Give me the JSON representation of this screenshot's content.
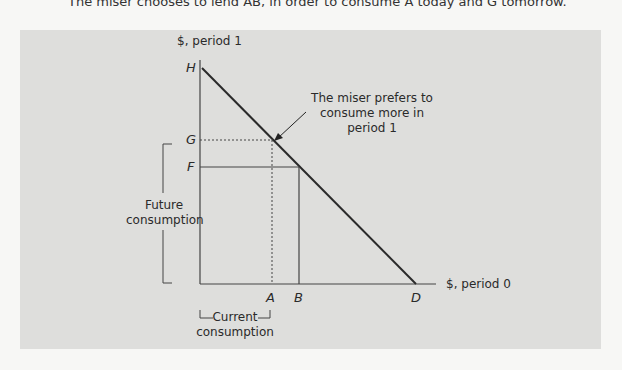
{
  "caption": "The miser chooses to lend AB, in order to consume A today and G tomorrow.",
  "axes": {
    "y_label": "$, period 1",
    "x_label": "$, period 0"
  },
  "points": {
    "H": "H",
    "G": "G",
    "F": "F",
    "A": "A",
    "B": "B",
    "D": "D"
  },
  "annotation": {
    "line1": "The miser prefers to",
    "line2": "consume more in",
    "line3": "period 1"
  },
  "brackets": {
    "future_line1": "Future",
    "future_line2": "consumption",
    "current_line1": "Current",
    "current_line2": "consumption"
  },
  "colors": {
    "panel": "#dededc",
    "line": "#333333",
    "budget_line": "#2a2a2a"
  }
}
